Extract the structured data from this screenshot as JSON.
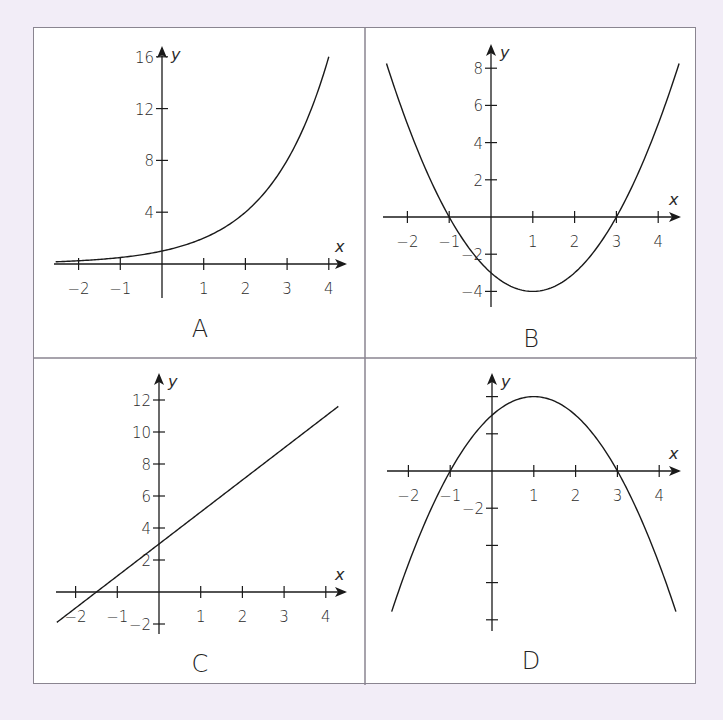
{
  "figure": {
    "background_color": "#f2edf7",
    "border_color": "#8a8590",
    "curve_color": "#1a1a1a"
  },
  "chart_data": [
    {
      "type": "line",
      "panel_label": "A",
      "function": "y = 2^x",
      "xlabel": "x",
      "ylabel": "y",
      "x_ticks": [
        "−2",
        "−1",
        "1",
        "2",
        "3",
        "4"
      ],
      "y_ticks": [
        "4",
        "8",
        "12",
        "16"
      ],
      "xlim": [
        -2.5,
        4.4
      ],
      "ylim": [
        0,
        16
      ],
      "grid": false,
      "x": [
        -2.5,
        -2,
        -1,
        0,
        1,
        2,
        3,
        4
      ],
      "y": [
        0.18,
        0.25,
        0.5,
        1,
        2,
        4,
        8,
        16
      ]
    },
    {
      "type": "line",
      "panel_label": "B",
      "function": "y = x^2 - 2x - 3",
      "xlabel": "x",
      "ylabel": "y",
      "x_ticks": [
        "−2",
        "−1",
        "1",
        "2",
        "3",
        "4"
      ],
      "y_ticks": [
        "8",
        "6",
        "4",
        "2",
        "−2",
        "−4"
      ],
      "xlim": [
        -2.5,
        4.5
      ],
      "ylim": [
        -5,
        9
      ],
      "grid": false,
      "x": [
        -2.5,
        -2,
        -1,
        0,
        1,
        2,
        3,
        4,
        4.5
      ],
      "y": [
        8.25,
        5,
        0,
        -3,
        -4,
        -3,
        0,
        5,
        8.25
      ],
      "roots": [
        -1,
        3
      ],
      "vertex": [
        1,
        -4
      ]
    },
    {
      "type": "line",
      "panel_label": "C",
      "function": "y = 2x + 3",
      "xlabel": "x",
      "ylabel": "y",
      "x_ticks": [
        "−2",
        "−1",
        "1",
        "2",
        "3",
        "4"
      ],
      "y_ticks": [
        "12",
        "10",
        "8",
        "6",
        "4",
        "2",
        "−2"
      ],
      "xlim": [
        -2.5,
        4.4
      ],
      "ylim": [
        -2.5,
        13
      ],
      "grid": false,
      "x": [
        -2.5,
        -1.5,
        0,
        1,
        2,
        3,
        4.3
      ],
      "y": [
        -2,
        0,
        3,
        5,
        7,
        9,
        11.6
      ],
      "y_intercept": 3,
      "x_intercept": -1.5
    },
    {
      "type": "line",
      "panel_label": "D",
      "function": "y = -x^2 + 2x + 3",
      "xlabel": "x",
      "ylabel": "y",
      "x_ticks": [
        "−2",
        "−1",
        "1",
        "2",
        "3",
        "4"
      ],
      "y_ticks": [
        "−2"
      ],
      "y_tick_marks_unlabeled": [
        4,
        2,
        -4,
        -6,
        -8
      ],
      "xlim": [
        -2.5,
        4.5
      ],
      "ylim": [
        -8.5,
        5
      ],
      "grid": false,
      "x": [
        -2.4,
        -2,
        -1,
        0,
        1,
        2,
        3,
        4,
        4.4
      ],
      "y": [
        -7.56,
        -5,
        0,
        3,
        4,
        3,
        0,
        -5,
        -7.56
      ],
      "roots": [
        -1,
        3
      ],
      "vertex": [
        1,
        4
      ]
    }
  ]
}
